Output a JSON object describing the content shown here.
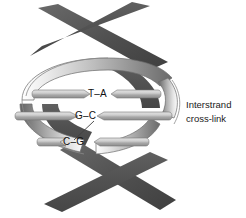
{
  "figure": {
    "background_color": "#ffffff"
  },
  "helix": {
    "back_ribbon_color": "#585858",
    "back_ribbon_color_dark": "#4a4a4a",
    "front_ribbon_color_light": "#f2f2f2",
    "front_ribbon_color_mid": "#b4b4b4",
    "front_ribbon_color_dark": "#6e6e6e",
    "outline_color": "#555555",
    "turns": 2
  },
  "base_pairs": [
    {
      "id": "bp-1",
      "label": "T–A",
      "left_base": "T",
      "right_base": "A",
      "rung_color_light": "#d8d8d8",
      "rung_color_dark": "#8a8a8a"
    },
    {
      "id": "bp-2",
      "label": "G–C",
      "left_base": "G",
      "right_base": "C",
      "rung_color_light": "#d8d8d8",
      "rung_color_dark": "#8a8a8a"
    },
    {
      "id": "bp-3",
      "label": "C–G",
      "left_base": "C",
      "right_base": "G",
      "rung_color_light": "#d8d8d8",
      "rung_color_dark": "#8a8a8a"
    }
  ],
  "crosslink": {
    "line_color": "#444444",
    "from_base_pair": "G–C",
    "to_base_pair": "C–G"
  },
  "annotation": {
    "line1": "Interstrand",
    "line2": "cross-link",
    "color": "#1a1a1a"
  }
}
